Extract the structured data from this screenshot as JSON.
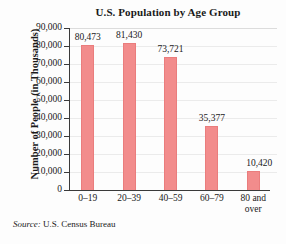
{
  "chart_data": {
    "type": "bar",
    "title": "U.S. Population by Age Group",
    "xlabel": "",
    "ylabel": "Number of People (in Thousands)",
    "categories": [
      "0–19",
      "20–39",
      "40–59",
      "60–79",
      "80 and over"
    ],
    "category_lines": [
      [
        "0–19"
      ],
      [
        "20–39"
      ],
      [
        "40–59"
      ],
      [
        "60–79"
      ],
      [
        "80 and",
        "over"
      ]
    ],
    "values": [
      80473,
      81430,
      73721,
      35377,
      10420
    ],
    "value_labels": [
      "80,473",
      "81,430",
      "73,721",
      "35,377",
      "10,420"
    ],
    "ylim": [
      0,
      90000
    ],
    "ytick_values": [
      0,
      10000,
      20000,
      30000,
      40000,
      50000,
      60000,
      70000,
      80000,
      90000
    ],
    "ytick_labels": [
      "0",
      "10,000",
      "20,000",
      "30,000",
      "40,000",
      "50,000",
      "60,000",
      "70,000",
      "80,000",
      "90,000"
    ],
    "grid": true,
    "legend": false,
    "bar_color": "#f28c8c",
    "bar_edge_color": "#ea7d7d"
  },
  "source": {
    "key": "Source:",
    "text": "U.S. Census Bureau"
  }
}
